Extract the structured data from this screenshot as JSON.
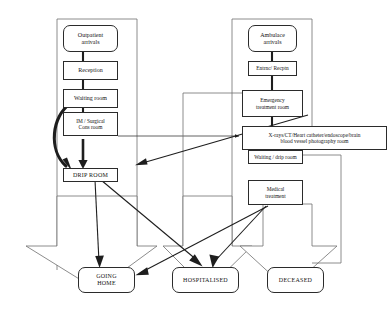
{
  "diagram": {
    "type": "flowchart",
    "colors": {
      "stroke": "#2b2b2b",
      "text": "#141414",
      "background": "#ffffff"
    },
    "nodes": {
      "outpatient_arrivals": {
        "label": "Outpatient\narrivals",
        "line1": "Outpatient",
        "line2": "arrivals",
        "shape": "rounded-rect"
      },
      "reception": {
        "label": "Reception",
        "shape": "rect"
      },
      "waiting_room": {
        "label": "Waiting room",
        "shape": "rect"
      },
      "im_surgical_cons_room": {
        "label": "IM / Surgical\nCons room",
        "line1": "IM / Surgical",
        "line2": "Cons room",
        "shape": "rect"
      },
      "drip_room": {
        "label": "DRIP ROOM",
        "shape": "rect"
      },
      "ambulance_arrivals": {
        "label": "Ambulace\narrivals",
        "line1": "Ambulace",
        "line2": "arrivals",
        "shape": "rounded-rect"
      },
      "entrance_reception": {
        "label": "Entrnc/ Recptn",
        "shape": "rect"
      },
      "emergency_treatment_room": {
        "label": "Emergency\ntreatment room",
        "line1": "Emergency",
        "line2": "treatment room",
        "shape": "rect"
      },
      "imaging_room": {
        "label": "X-rays/CT/Heart catheter/endoscope/brain\nblood vessel photography room",
        "line1": "X-rays/CT/Heart catheter/endoscope/brain",
        "line2": "blood vessel photography room",
        "shape": "rect"
      },
      "waiting_drip_room": {
        "label": "Waiting / drip room",
        "shape": "rect"
      },
      "medical_treatment": {
        "label": "Medical\ntreatment",
        "line1": "Medical",
        "line2": "treatment",
        "shape": "rect"
      },
      "going_home": {
        "label": "GOING\nHOME",
        "line1": "GOING",
        "line2": "HOME",
        "shape": "rounded-rect"
      },
      "hospitalised": {
        "label": "HOSPITALISED",
        "shape": "rounded-rect"
      },
      "deceased": {
        "label": "DECEASED",
        "shape": "rounded-rect"
      }
    },
    "edges": [
      {
        "from": "outpatient_arrivals",
        "to": "reception",
        "style": "thick-bar"
      },
      {
        "from": "reception",
        "to": "waiting_room",
        "style": "thick-bar"
      },
      {
        "from": "waiting_room",
        "to": "im_surgical_cons_room",
        "style": "thick-bar"
      },
      {
        "from": "im_surgical_cons_room",
        "to": "drip_room",
        "style": "thick-arrow"
      },
      {
        "from": "waiting_room",
        "to": "drip_room",
        "style": "thick-curved-arrow"
      },
      {
        "from": "im_surgical_cons_room",
        "to": "imaging_room",
        "style": "thin-arrow"
      },
      {
        "from": "ambulance_arrivals",
        "to": "entrance_reception",
        "style": "thick-bar"
      },
      {
        "from": "entrance_reception",
        "to": "emergency_treatment_room",
        "style": "thick-bar"
      },
      {
        "from": "emergency_treatment_room",
        "to": "imaging_room",
        "style": "thick-bar"
      },
      {
        "from": "emergency_treatment_room",
        "to": "drip_room",
        "style": "thin-arrow-diagonal"
      },
      {
        "from": "imaging_room",
        "to": "waiting_drip_room",
        "style": "thick-bar"
      },
      {
        "from": "waiting_drip_room",
        "to": "medical_treatment",
        "style": "thick-arrow"
      },
      {
        "from": "drip_room",
        "to": "going_home",
        "style": "thin-arrow"
      },
      {
        "from": "drip_room",
        "to": "hospitalised",
        "style": "thin-arrow-diagonal"
      },
      {
        "from": "medical_treatment",
        "to": "going_home",
        "style": "thin-arrow-diagonal"
      },
      {
        "from": "medical_treatment",
        "to": "hospitalised",
        "style": "thin-arrow-diagonal"
      },
      {
        "from": "medical_treatment",
        "to": "deceased",
        "style": "block-arrow"
      },
      {
        "from": "drip_room",
        "to": "going_home",
        "style": "block-arrow"
      },
      {
        "from": "imaging_room",
        "to": "hospitalised",
        "style": "block-arrow"
      },
      {
        "from": "going_home",
        "to": "outpatient_arrivals",
        "style": "return-rail"
      },
      {
        "from": "going_home",
        "to": "ambulance_arrivals",
        "style": "return-rail"
      }
    ]
  }
}
